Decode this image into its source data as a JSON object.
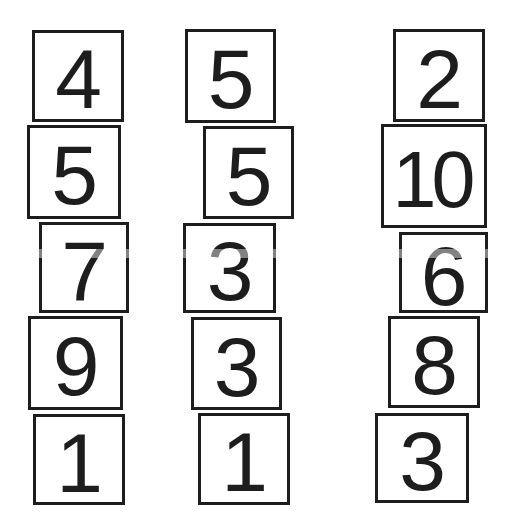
{
  "figure": {
    "colors": {
      "background": "#ffffff",
      "block_fill": "#ffffff",
      "block_border": "#1d1d1d",
      "digit": "#1d1d1d"
    },
    "columns": [
      {
        "label": "column-1",
        "blocks": [
          {
            "value": "4"
          },
          {
            "value": "5"
          },
          {
            "value": "7"
          },
          {
            "value": "9"
          },
          {
            "value": "1"
          }
        ]
      },
      {
        "label": "column-2",
        "blocks": [
          {
            "value": "5"
          },
          {
            "value": "5"
          },
          {
            "value": "3"
          },
          {
            "value": "3"
          },
          {
            "value": "1"
          }
        ]
      },
      {
        "label": "column-3",
        "blocks": [
          {
            "value": "2"
          },
          {
            "value": "10"
          },
          {
            "value": "6"
          },
          {
            "value": "8"
          },
          {
            "value": "3"
          }
        ]
      }
    ]
  }
}
